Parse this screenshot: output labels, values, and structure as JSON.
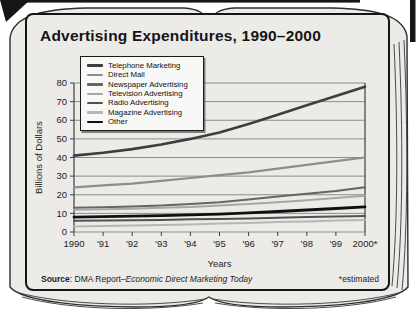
{
  "book": {
    "page_color": "#ecebe8",
    "edge_color": "#3a3a3a",
    "cover_color": "#161616"
  },
  "chart_card": {
    "title": "Advertising Expenditures, 1990–2000",
    "source_label": "Source",
    "source_separator": ": DMA Report–",
    "source_publication": "Economic Direct Marketing Today",
    "estimated_note": "*estimated"
  },
  "chart_data": {
    "type": "line",
    "title": "Advertising Expenditures, 1990–2000",
    "xlabel": "Years",
    "ylabel": "Billions of Dollars",
    "years": [
      1990,
      1991,
      1992,
      1993,
      1994,
      1995,
      1996,
      1997,
      1998,
      1999,
      2000
    ],
    "x_ticks": [
      "1990",
      "'91",
      "'92",
      "'93",
      "'94",
      "'95",
      "'96",
      "'97",
      "'98",
      "'99",
      "2000*"
    ],
    "ylim": [
      0,
      80
    ],
    "y_ticks": [
      0,
      10,
      20,
      30,
      40,
      50,
      60,
      70,
      80
    ],
    "grid": true,
    "legend_position": "upper-left",
    "series": [
      {
        "name": "Telephone Marketing",
        "color": "#3e3e3e",
        "width": 2.6,
        "values": [
          41,
          42.5,
          44.5,
          47,
          50,
          53.5,
          58,
          63,
          68,
          73,
          78
        ]
      },
      {
        "name": "Direct Mail",
        "color": "#8d8d8d",
        "width": 2.2,
        "values": [
          24,
          25,
          26,
          27.5,
          29,
          30.5,
          32,
          34,
          36,
          38,
          40
        ]
      },
      {
        "name": "Newspaper Advertising",
        "color": "#656565",
        "width": 2,
        "values": [
          13,
          13.3,
          13.7,
          14.2,
          15,
          16,
          17.5,
          19,
          20.5,
          22,
          24
        ]
      },
      {
        "name": "Television Advertising",
        "color": "#a7a7a7",
        "width": 2,
        "values": [
          12,
          12.2,
          12.5,
          13,
          13.5,
          14.2,
          15,
          16,
          17,
          18.3,
          19.5
        ]
      },
      {
        "name": "Radio Advertising",
        "color": "#525252",
        "width": 2,
        "values": [
          6,
          6.1,
          6.3,
          6.5,
          6.8,
          7,
          7.3,
          7.7,
          8,
          8.3,
          8.6
        ]
      },
      {
        "name": "Magazine Advertising",
        "color": "#b6b6b6",
        "width": 2,
        "values": [
          3,
          3.2,
          3.5,
          3.8,
          4.1,
          4.5,
          4.9,
          5.3,
          5.7,
          6.1,
          6.5
        ]
      },
      {
        "name": "Other",
        "color": "#101010",
        "width": 2.8,
        "values": [
          8,
          8.2,
          8.5,
          8.8,
          9.2,
          9.6,
          10.3,
          11,
          11.8,
          12.6,
          13.5
        ]
      }
    ]
  }
}
